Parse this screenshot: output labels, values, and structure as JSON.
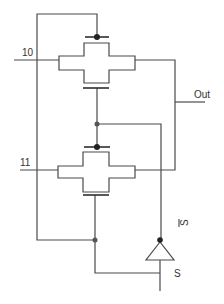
{
  "diagram": {
    "type": "transmission-gate multiplexer",
    "labels": {
      "input_top": "10",
      "input_bottom": "11",
      "output": "Out",
      "select": "S",
      "select_bar": "S̅",
      "select_bar_base": "S"
    },
    "components": [
      {
        "id": "tgate-1",
        "kind": "transmission-gate",
        "input": "10"
      },
      {
        "id": "tgate-2",
        "kind": "transmission-gate",
        "input": "11"
      },
      {
        "id": "inverter",
        "kind": "inverter",
        "input": "S",
        "output": "S-bar"
      }
    ],
    "colors": {
      "wire": "#4a4a4a",
      "background": "#ffffff"
    }
  }
}
